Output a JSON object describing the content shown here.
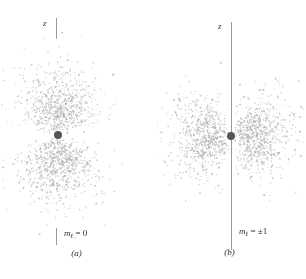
{
  "figure": {
    "dot_color": "#b0b0b0",
    "nucleus_color": "#555555",
    "axis_color": "#9a9a9a",
    "background": "#ffffff"
  },
  "panels": [
    {
      "id": "a",
      "caption": "(a)",
      "z_axis_label": "z",
      "quantum_number_symbol": "m",
      "quantum_number_subscript": "ℓ",
      "quantum_number_value": "= 0",
      "quantum_number_full": "mℓ = 0",
      "axis_style": "stubs",
      "orbital_shape": "vertical-dumbbell"
    },
    {
      "id": "b",
      "caption": "(b)",
      "z_axis_label": "z",
      "quantum_number_symbol": "m",
      "quantum_number_subscript": "ℓ",
      "quantum_number_value": "= ±1",
      "quantum_number_full": "mℓ = ±1",
      "axis_style": "full-line",
      "orbital_shape": "horizontal-torus-section"
    }
  ],
  "chart_data": {
    "type": "scatter",
    "title": "",
    "xlabel": "",
    "ylabel": "z",
    "legend": [],
    "grid": false,
    "series": [
      {
        "name": "mℓ = 0 probability cloud",
        "panel": "a",
        "n_points": 1500,
        "distribution": "cos^2(theta) dumbbell along z",
        "center": [
          58,
          135
        ],
        "lobe_centers": [
          [
            58,
            92
          ],
          [
            58,
            180
          ]
        ],
        "lobe_radius_x": 40,
        "lobe_radius_y": 48
      },
      {
        "name": "mℓ = ±1 probability cloud",
        "panel": "b",
        "n_points": 1500,
        "distribution": "sin^2(theta) torus section perpendicular to z",
        "center": [
          78,
          136
        ],
        "lobe_centers": [
          [
            34,
            136
          ],
          [
            122,
            136
          ]
        ],
        "lobe_radius_x": 44,
        "lobe_radius_y": 42
      }
    ]
  }
}
